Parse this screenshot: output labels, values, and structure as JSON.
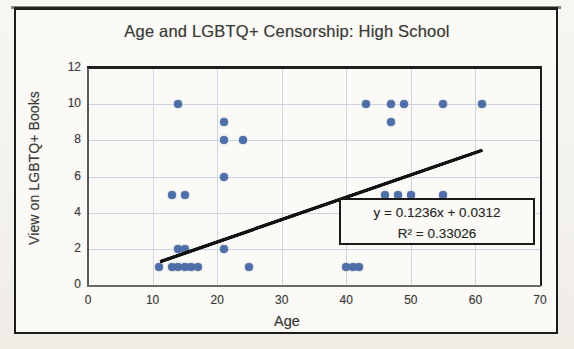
{
  "chart_data": {
    "type": "scatter",
    "title": "Age and LGBTQ+ Censorship: High School",
    "xlabel": "Age",
    "ylabel": "View on LGBTQ+ Books",
    "xlim": [
      0,
      70
    ],
    "ylim": [
      0,
      12
    ],
    "xticks": [
      "0",
      "10",
      "20",
      "30",
      "40",
      "50",
      "60",
      "70"
    ],
    "yticks": [
      "0",
      "2",
      "4",
      "6",
      "8",
      "10",
      "12"
    ],
    "xtick_values": [
      0,
      10,
      20,
      30,
      40,
      50,
      60,
      70
    ],
    "ytick_values": [
      0,
      2,
      4,
      6,
      8,
      10,
      12
    ],
    "grid": true,
    "legend": "none",
    "marker_color": "#4f6fa8",
    "trendline_color": "#131313",
    "points": [
      [
        11,
        1
      ],
      [
        13,
        1
      ],
      [
        14,
        1
      ],
      [
        15,
        1
      ],
      [
        16,
        1
      ],
      [
        17,
        1
      ],
      [
        14,
        2
      ],
      [
        15,
        2
      ],
      [
        21,
        2
      ],
      [
        25,
        1
      ],
      [
        13,
        5
      ],
      [
        15,
        5
      ],
      [
        21,
        6
      ],
      [
        21,
        8
      ],
      [
        24,
        8
      ],
      [
        21,
        9
      ],
      [
        14,
        10
      ],
      [
        40,
        1
      ],
      [
        41,
        1
      ],
      [
        42,
        1
      ],
      [
        46,
        5
      ],
      [
        48,
        5
      ],
      [
        50,
        5
      ],
      [
        55,
        5
      ],
      [
        47,
        9
      ],
      [
        43,
        10
      ],
      [
        47,
        10
      ],
      [
        49,
        10
      ],
      [
        55,
        10
      ],
      [
        61,
        10
      ]
    ],
    "trendline": {
      "slope": 0.1236,
      "intercept": 0.0312,
      "r_squared": 0.33026,
      "x_start": 11,
      "x_end": 61,
      "equation_label": "y = 0.1236x + 0.0312",
      "r2_label": "R² = 0.33026"
    }
  }
}
